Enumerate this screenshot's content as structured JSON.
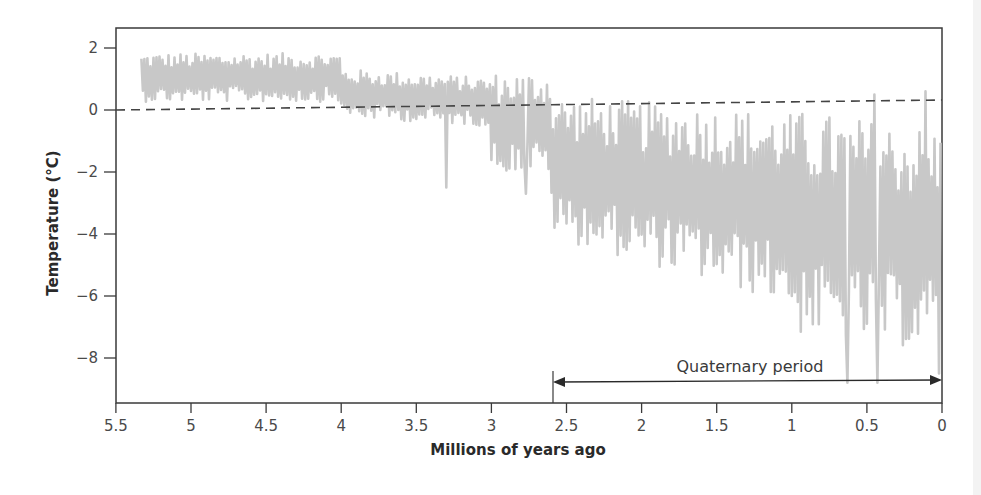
{
  "chart_data": {
    "type": "line",
    "title": "",
    "xlabel": "Millions of years ago",
    "ylabel": "Temperature (°C)",
    "xlim": [
      5.5,
      0
    ],
    "ylim": [
      -9.3,
      2.6
    ],
    "x_reversed": true,
    "grid": false,
    "legend": null,
    "xticks": [
      5.5,
      5,
      4.5,
      4,
      3.5,
      3,
      2.5,
      2,
      1.5,
      1,
      0.5,
      0
    ],
    "xtick_labels": [
      "5.5",
      "5",
      "4.5",
      "4",
      "3.5",
      "3",
      "2.5",
      "2",
      "1.5",
      "1",
      "0.5",
      "0"
    ],
    "yticks": [
      2,
      0,
      -2,
      -4,
      -6,
      -8
    ],
    "ytick_labels": [
      "2",
      "0",
      "−2",
      "−4",
      "−6",
      "−8"
    ],
    "series": [
      {
        "name": "Temperature anomaly",
        "color": "#c8c8c8",
        "x": [
          5.33,
          5.32,
          5.31,
          5.3,
          5.29,
          5.28,
          5.27,
          5.26,
          5.25,
          5.24,
          5.23,
          5.22,
          5.21,
          5.2,
          5.19,
          5.18,
          5.17,
          5.16,
          5.15,
          5.14,
          5.13,
          5.12,
          5.11,
          5.1,
          5.09,
          5.08,
          5.07,
          5.06,
          5.05,
          5.04,
          5.03,
          5.02,
          5.01,
          5.0,
          4.99,
          4.98,
          4.97,
          4.96,
          4.95,
          4.94,
          4.93,
          4.92,
          4.91,
          4.9,
          4.89,
          4.88,
          4.87,
          4.86,
          4.85,
          4.84,
          4.83,
          4.82,
          4.81,
          4.8,
          4.79,
          4.78,
          4.77,
          4.76,
          4.75,
          4.74,
          4.73,
          4.72,
          4.71,
          4.7,
          4.69,
          4.68,
          4.67,
          4.66,
          4.65,
          4.64,
          4.63,
          4.62,
          4.61,
          4.6,
          4.59,
          4.58,
          4.57,
          4.56,
          4.55,
          4.54,
          4.53,
          4.52,
          4.51,
          4.5,
          4.49,
          4.48,
          4.47,
          4.46,
          4.45,
          4.44,
          4.43,
          4.42,
          4.41,
          4.4,
          4.39,
          4.38,
          4.37,
          4.36,
          4.35,
          4.34,
          4.33,
          4.32,
          4.31,
          4.3,
          4.29,
          4.28,
          4.27,
          4.26,
          4.25,
          4.24,
          4.23,
          4.22,
          4.21,
          4.2,
          4.19,
          4.18,
          4.17,
          4.16,
          4.15,
          4.14,
          4.13,
          4.12,
          4.11,
          4.1,
          4.09,
          4.08,
          4.07,
          4.06,
          4.05,
          4.04,
          4.03,
          4.02,
          4.01,
          4.0,
          3.99,
          3.98,
          3.97,
          3.96,
          3.95,
          3.94,
          3.93,
          3.92,
          3.91,
          3.9,
          3.89,
          3.88,
          3.87,
          3.86,
          3.85,
          3.84,
          3.83,
          3.82,
          3.81,
          3.8,
          3.79,
          3.78,
          3.77,
          3.76,
          3.75,
          3.74,
          3.73,
          3.72,
          3.71,
          3.7,
          3.69,
          3.68,
          3.67,
          3.66,
          3.65,
          3.64,
          3.63,
          3.62,
          3.61,
          3.6,
          3.59,
          3.58,
          3.57,
          3.56,
          3.55,
          3.54,
          3.53,
          3.52,
          3.51,
          3.5,
          3.49,
          3.48,
          3.47,
          3.46,
          3.45,
          3.44,
          3.43,
          3.42,
          3.41,
          3.4,
          3.39,
          3.38,
          3.37,
          3.36,
          3.35,
          3.34,
          3.33,
          3.32,
          3.31,
          3.3,
          3.29,
          3.28,
          3.27,
          3.26,
          3.25,
          3.24,
          3.23,
          3.22,
          3.21,
          3.2,
          3.19,
          3.18,
          3.17,
          3.16,
          3.15,
          3.14,
          3.13,
          3.12,
          3.11,
          3.1,
          3.09,
          3.08,
          3.07,
          3.06,
          3.05,
          3.04,
          3.03,
          3.02,
          3.01,
          3.0,
          2.99,
          2.98,
          2.97,
          2.96,
          2.95,
          2.94,
          2.93,
          2.92,
          2.91,
          2.9,
          2.89,
          2.88,
          2.87,
          2.86,
          2.85,
          2.84,
          2.83,
          2.82,
          2.81,
          2.8,
          2.79,
          2.78,
          2.77,
          2.76,
          2.75,
          2.74,
          2.73,
          2.72,
          2.71,
          2.7,
          2.69,
          2.68,
          2.67,
          2.66,
          2.65,
          2.64,
          2.63,
          2.62,
          2.61,
          2.6,
          2.59,
          2.58,
          2.57,
          2.56,
          2.55,
          2.54,
          2.53,
          2.52,
          2.51,
          2.5,
          2.49,
          2.48,
          2.47,
          2.46,
          2.45,
          2.44,
          2.43,
          2.42,
          2.41,
          2.4,
          2.39,
          2.38,
          2.37,
          2.36,
          2.35,
          2.34,
          2.33,
          2.32,
          2.31,
          2.3,
          2.29,
          2.28,
          2.27,
          2.26,
          2.25,
          2.24,
          2.23,
          2.22,
          2.21,
          2.2,
          2.19,
          2.18,
          2.17,
          2.16,
          2.15,
          2.14,
          2.13,
          2.12,
          2.11,
          2.1,
          2.09,
          2.08,
          2.07,
          2.06,
          2.05,
          2.04,
          2.03,
          2.02,
          2.01,
          2.0,
          1.99,
          1.98,
          1.97,
          1.96,
          1.95,
          1.94,
          1.93,
          1.92,
          1.91,
          1.9,
          1.89,
          1.88,
          1.87,
          1.86,
          1.85,
          1.84,
          1.83,
          1.82,
          1.81,
          1.8,
          1.79,
          1.78,
          1.77,
          1.76,
          1.75,
          1.74,
          1.73,
          1.72,
          1.71,
          1.7,
          1.69,
          1.68,
          1.67,
          1.66,
          1.65,
          1.64,
          1.63,
          1.62,
          1.61,
          1.6,
          1.59,
          1.58,
          1.57,
          1.56,
          1.55,
          1.54,
          1.53,
          1.52,
          1.51,
          1.5,
          1.49,
          1.48,
          1.47,
          1.46,
          1.45,
          1.44,
          1.43,
          1.42,
          1.41,
          1.4,
          1.39,
          1.38,
          1.37,
          1.36,
          1.35,
          1.34,
          1.33,
          1.32,
          1.31,
          1.3,
          1.29,
          1.28,
          1.27,
          1.26,
          1.25,
          1.24,
          1.23,
          1.22,
          1.21,
          1.2,
          1.19,
          1.18,
          1.17,
          1.16,
          1.15,
          1.14,
          1.13,
          1.12,
          1.11,
          1.1,
          1.09,
          1.08,
          1.07,
          1.06,
          1.05,
          1.04,
          1.03,
          1.02,
          1.01,
          1.0,
          0.99,
          0.98,
          0.97,
          0.96,
          0.95,
          0.94,
          0.93,
          0.92,
          0.91,
          0.9,
          0.89,
          0.88,
          0.87,
          0.86,
          0.85,
          0.84,
          0.83,
          0.82,
          0.81,
          0.8,
          0.79,
          0.78,
          0.77,
          0.76,
          0.75,
          0.74,
          0.73,
          0.72,
          0.71,
          0.7,
          0.69,
          0.68,
          0.67,
          0.66,
          0.65,
          0.64,
          0.63,
          0.62,
          0.61,
          0.6,
          0.59,
          0.58,
          0.57,
          0.56,
          0.55,
          0.54,
          0.53,
          0.52,
          0.51,
          0.5,
          0.49,
          0.48,
          0.47,
          0.46,
          0.45,
          0.44,
          0.43,
          0.42,
          0.41,
          0.4,
          0.39,
          0.38,
          0.37,
          0.36,
          0.35,
          0.34,
          0.33,
          0.32,
          0.31,
          0.3,
          0.29,
          0.28,
          0.27,
          0.26,
          0.25,
          0.24,
          0.23,
          0.22,
          0.21,
          0.2,
          0.19,
          0.18,
          0.17,
          0.16,
          0.15,
          0.14,
          0.13,
          0.12,
          0.11,
          0.1,
          0.09,
          0.08,
          0.07,
          0.06,
          0.05,
          0.04,
          0.03,
          0.02,
          0.01
        ],
        "summary": {
          "5.3-4.0_Ma": "fluctuates roughly between −0.5 and +2.5 °C, mean ≈ +1",
          "4.0-3.0_Ma": "mean ≈ +0.5, dips to −1 and one spike to −2.5 near 3.3 Ma",
          "3.0-2.6_Ma": "mean ≈ −0.5, dips to −2.7",
          "2.6-1.0_Ma": "glacial cycles, peaks ≈ 0 to −1, troughs ≈ −4 to −6",
          "1.0-0_Ma": "large-amplitude cycles, peaks up to +0.5, troughs to ≈ −8.8"
        }
      }
    ],
    "reference_line": {
      "label": "",
      "style": "dashed",
      "color": "#444444",
      "y_left": 0,
      "y_right": 0.3
    },
    "annotations": [
      {
        "text": "Quaternary period",
        "type": "double-arrow",
        "x_start": 2.6,
        "x_end": 0,
        "y": -8.6
      }
    ]
  },
  "axes": {
    "x_title": "Millions of years ago",
    "y_title": "Temperature (°C)"
  },
  "annotation": {
    "quaternary_label": "Quaternary period"
  }
}
